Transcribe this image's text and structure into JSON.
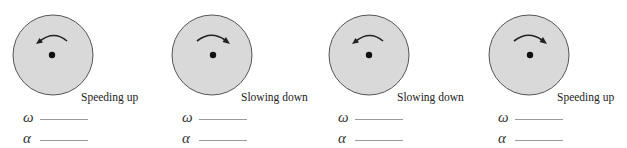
{
  "colors": {
    "background": "#ffffff",
    "disk_fill": "#d9d9d9",
    "disk_outline": "#555555",
    "axle": "#111111",
    "arrow": "#222222",
    "blank_line": "#9a9a9a"
  },
  "panels": [
    {
      "state_label": "Speeding up",
      "rotation_arrow": "counterclockwise",
      "arrow_icon": "counterclockwise-arrow-icon",
      "omega_symbol": "ω",
      "omega_value": "",
      "alpha_symbol": "α",
      "alpha_value": ""
    },
    {
      "state_label": "Slowing down",
      "rotation_arrow": "clockwise",
      "arrow_icon": "clockwise-arrow-icon",
      "omega_symbol": "ω",
      "omega_value": "",
      "alpha_symbol": "α",
      "alpha_value": ""
    },
    {
      "state_label": "Slowing down",
      "rotation_arrow": "counterclockwise",
      "arrow_icon": "counterclockwise-arrow-icon",
      "omega_symbol": "ω",
      "omega_value": "",
      "alpha_symbol": "α",
      "alpha_value": ""
    },
    {
      "state_label": "Speeding up",
      "rotation_arrow": "clockwise",
      "arrow_icon": "clockwise-arrow-icon",
      "omega_symbol": "ω",
      "omega_value": "",
      "alpha_symbol": "α",
      "alpha_value": ""
    }
  ]
}
